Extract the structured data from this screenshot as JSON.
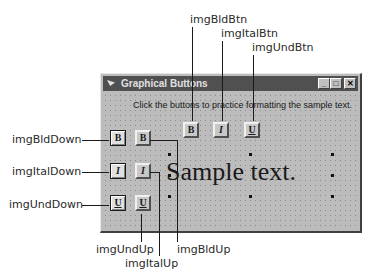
{
  "window": {
    "title": "Graphical Buttons",
    "controls": {
      "minimize": "_",
      "maximize": "□",
      "close": "✕"
    },
    "instruction": "Click the buttons to practice formatting the sample text.",
    "sample_text": "Sample text."
  },
  "buttons": {
    "bold_btn": "B",
    "italic_btn": "I",
    "underline_btn": "U",
    "bold_down": "B",
    "bold_up": "B",
    "italic_down": "I",
    "italic_up": "I",
    "underline_down": "U",
    "underline_up": "U"
  },
  "callouts": {
    "imgBldBtn": "imgBldBtn",
    "imgItalBtn": "imgItalBtn",
    "imgUndBtn": "imgUndBtn",
    "imgBldDown": "imgBldDown",
    "imgItalDown": "imgItalDown",
    "imgUndDown": "imgUndDown",
    "imgUndUp": "imgUndUp",
    "imgItalUp": "imgItalUp",
    "imgBldUp": "imgBldUp"
  }
}
